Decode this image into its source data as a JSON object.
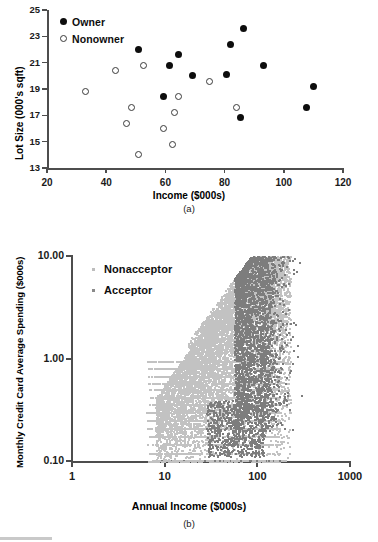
{
  "figure": {
    "panels": [
      {
        "caption": "(a)",
        "chart_data": {
          "type": "scatter",
          "title": "",
          "xlabel": "Income ($000s)",
          "ylabel": "Lot Size (000's sqft)",
          "xlim": [
            20,
            120
          ],
          "ylim": [
            13,
            25
          ],
          "xticks": [
            20,
            40,
            60,
            80,
            100,
            120
          ],
          "yticks": [
            13,
            15,
            17,
            19,
            21,
            23,
            25
          ],
          "grid": false,
          "legend_position": "top-left",
          "series": [
            {
              "name": "Owner",
              "marker": "filled-circle",
              "color": "#0d0d0d",
              "points": [
                [
                  51.0,
                  22.0
                ],
                [
                  61.5,
                  20.8
                ],
                [
                  64.5,
                  21.6
                ],
                [
                  59.5,
                  18.4
                ],
                [
                  69.0,
                  20.0
                ],
                [
                  80.5,
                  20.1
                ],
                [
                  82.0,
                  22.4
                ],
                [
                  86.5,
                  23.6
                ],
                [
                  85.5,
                  16.8
                ],
                [
                  93.0,
                  20.8
                ],
                [
                  107.5,
                  17.6
                ],
                [
                  110.0,
                  19.2
                ]
              ]
            },
            {
              "name": "Nonowner",
              "marker": "open-circle",
              "color": "#3a3a3a",
              "points": [
                [
                  33.0,
                  18.8
                ],
                [
                  43.0,
                  20.4
                ],
                [
                  47.0,
                  16.4
                ],
                [
                  48.5,
                  17.6
                ],
                [
                  51.0,
                  14.0
                ],
                [
                  52.5,
                  20.8
                ],
                [
                  59.5,
                  16.0
                ],
                [
                  62.5,
                  14.8
                ],
                [
                  63.0,
                  17.2
                ],
                [
                  64.5,
                  18.4
                ],
                [
                  75.0,
                  19.6
                ],
                [
                  84.0,
                  17.6
                ]
              ]
            }
          ]
        }
      },
      {
        "caption": "(b)",
        "chart_data": {
          "type": "scatter",
          "title": "",
          "xlabel": "Annual Income ($000s)",
          "ylabel": "Monthly Credit Card Average Spending ($000s)",
          "xscale": "log",
          "yscale": "log",
          "xlim": [
            1,
            1000
          ],
          "ylim": [
            0.1,
            10.0
          ],
          "xticks": [
            1,
            10,
            100,
            1000
          ],
          "xticklabels": [
            "1",
            "10",
            "100",
            "1000"
          ],
          "yticks": [
            0.1,
            1.0,
            10.0
          ],
          "yticklabels": [
            "0.10",
            "1.00",
            "10.00"
          ],
          "grid": false,
          "legend_position": "upper-left-inside",
          "series": [
            {
              "name": "Nonacceptor",
              "marker": "small-square",
              "color": "#b5b5b5",
              "n_points": 4520,
              "density_note": "dense light-gray cloud rising from (7, 0.1) to (200, 9); discrete horizontal bands below y=1"
            },
            {
              "name": "Acceptor",
              "marker": "small-square",
              "color": "#6e6e6e",
              "n_points": 480,
              "density_note": "darker gray cloud concentrated at high income (80-220) and high spending (1-10)"
            }
          ]
        }
      }
    ]
  }
}
